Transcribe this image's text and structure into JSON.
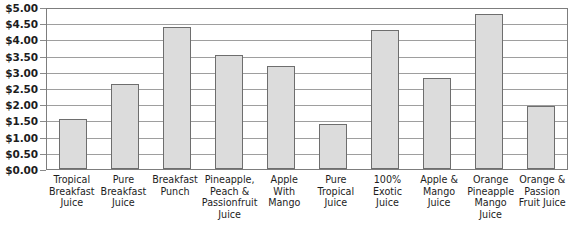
{
  "chart_data": {
    "type": "bar",
    "title": "",
    "xlabel": "",
    "ylabel": "",
    "ylim": [
      0,
      5
    ],
    "grid": true,
    "legend": false,
    "y_tick_labels": [
      "$5.00",
      "$4.50",
      "$4.00",
      "$3.50",
      "$3.00",
      "$2.50",
      "$2.00",
      "$1.50",
      "$1.00",
      "$0.50",
      "$0.00"
    ],
    "y_tick_values": [
      5.0,
      4.5,
      4.0,
      3.5,
      3.0,
      2.5,
      2.0,
      1.5,
      1.0,
      0.5,
      0.0
    ],
    "categories": [
      "Tropical Breakfast Juice",
      "Pure Breakfast Juice",
      "Breakfast Punch",
      "Pineapple, Peach & Passionfruit Juice",
      "Apple With Mango",
      "Pure Tropical Juice",
      "100% Exotic Juice",
      "Apple & Mango Juice",
      "Orange Pineapple Mango Juice",
      "Orange & Passion Fruit Juice"
    ],
    "values": [
      1.53,
      2.62,
      4.39,
      3.52,
      3.17,
      1.38,
      4.28,
      2.82,
      4.77,
      1.95
    ],
    "bar_fill_color": "#dcdcdc",
    "bar_border_color": "#6e6e6e",
    "gridline_color": "#9e9e9e",
    "axis_color": "#7d7d7d"
  },
  "footer": {
    "source_text": ""
  }
}
